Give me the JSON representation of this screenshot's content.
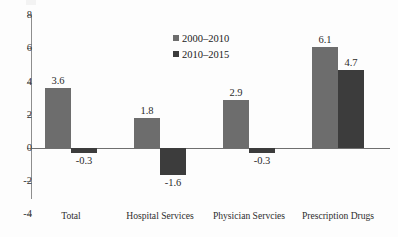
{
  "chart_data": {
    "type": "bar",
    "title": "",
    "xlabel": "",
    "ylabel": "",
    "ylim": [
      -4,
      8
    ],
    "ytick_step": 2,
    "grid": false,
    "legend_position": "upper-center",
    "categories": [
      "Total",
      "Hospital Services",
      "Physician Servcies",
      "Prescription Drugs"
    ],
    "series": [
      {
        "name": "2000–2010",
        "color": "#6d6d6d",
        "values": [
          3.6,
          1.8,
          2.9,
          6.1
        ]
      },
      {
        "name": "2010–2015",
        "color": "#3c3c3c",
        "values": [
          -0.3,
          -1.6,
          -0.3,
          4.7
        ]
      }
    ],
    "yticks": [
      {
        "value": 8,
        "label": "8"
      },
      {
        "value": 6,
        "label": "6"
      },
      {
        "value": 4,
        "label": "4"
      },
      {
        "value": 2,
        "label": "2"
      },
      {
        "value": 0,
        "label": "0"
      },
      {
        "value": -2,
        "label": "-2"
      },
      {
        "value": -4,
        "label": "-4"
      }
    ],
    "bar_labels": [
      {
        "text": "3.6"
      },
      {
        "text": "-0.3"
      },
      {
        "text": "1.8"
      },
      {
        "text": "-1.6"
      },
      {
        "text": "2.9"
      },
      {
        "text": "-0.3"
      },
      {
        "text": "6.1"
      },
      {
        "text": "4.7"
      }
    ]
  },
  "legend": {
    "items": [
      {
        "label": "2000–2010"
      },
      {
        "label": "2010–2015"
      }
    ]
  }
}
